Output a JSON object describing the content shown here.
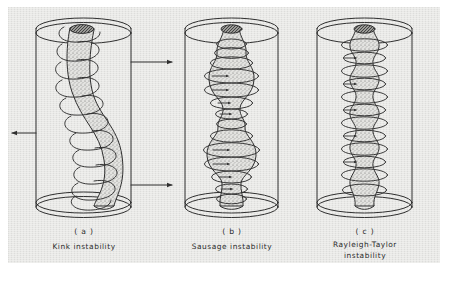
{
  "figure": {
    "background_color": "#e9e9e7",
    "ink_color": "#2f2f2f",
    "plasma_fill_color": "#dcdcda"
  },
  "panels": [
    {
      "id": "a",
      "index_label": "( a )",
      "caption": "Kink instability",
      "caption_lines": [
        "Kink instability"
      ],
      "column_shape": "helical S-shaped kinked column",
      "coil_turns": 11,
      "arrows": [
        {
          "name": "arrow-right-top",
          "direction": "right",
          "y": 62
        },
        {
          "name": "arrow-left-middle",
          "direction": "left",
          "y": 133
        },
        {
          "name": "arrow-right-bottom",
          "direction": "right",
          "y": 185
        }
      ]
    },
    {
      "id": "b",
      "index_label": "( b )",
      "caption": "Sausage instability",
      "caption_lines": [
        "Sausage instability"
      ],
      "column_shape": "alternating bulges and necks",
      "coil_turns": 13,
      "arrows": []
    },
    {
      "id": "c",
      "index_label": "( c )",
      "caption": "Rayleigh-Taylor\ninstability",
      "caption_lines": [
        "Rayleigh-Taylor",
        "instability"
      ],
      "column_shape": "straight column with flute ripples",
      "coil_turns": 12,
      "arrows": []
    }
  ]
}
